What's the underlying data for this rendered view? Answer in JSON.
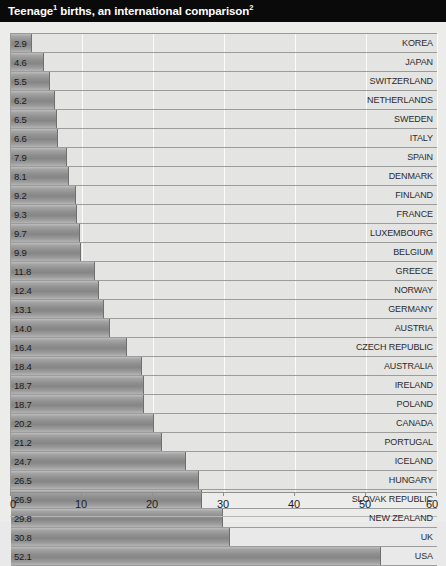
{
  "header": {
    "title_part1": "Teenage",
    "title_sup1": "1",
    "title_part2": " births,  an international comparison",
    "title_sup2": "2",
    "title_full": "Teenage¹ births,  an international comparison²",
    "background_color": "#0a0a0a",
    "text_color": "#ffffff"
  },
  "chart_data": {
    "type": "bar",
    "orientation": "horizontal",
    "xlabel": "",
    "ylabel": "",
    "xlim": [
      0,
      60
    ],
    "xticks": [
      "0",
      "10",
      "20",
      "30",
      "40",
      "50",
      "60"
    ],
    "xtick_values": [
      0,
      10,
      20,
      30,
      40,
      50,
      60
    ],
    "grid": "vertical",
    "legend": "none",
    "bar_color": "#8e8e8e",
    "categories": [
      "KOREA",
      "JAPAN",
      "SWITZERLAND",
      "NETHERLANDS",
      "SWEDEN",
      "ITALY",
      "SPAIN",
      "DENMARK",
      "FINLAND",
      "FRANCE",
      "LUXEMBOURG",
      "BELGIUM",
      "GREECE",
      "NORWAY",
      "GERMANY",
      "AUSTRIA",
      "CZECH REPUBLIC",
      "AUSTRALIA",
      "IRELAND",
      "POLAND",
      "CANADA",
      "PORTUGAL",
      "ICELAND",
      "HUNGARY",
      "SLOVAK REPUBLIC",
      "NEW ZEALAND",
      "UK",
      "USA"
    ],
    "values": [
      2.9,
      4.6,
      5.5,
      6.2,
      6.5,
      6.6,
      7.9,
      8.1,
      9.2,
      9.3,
      9.7,
      9.9,
      11.8,
      12.4,
      13.1,
      14.0,
      16.4,
      18.4,
      18.7,
      18.7,
      20.2,
      21.2,
      24.7,
      26.5,
      26.9,
      29.8,
      30.8,
      52.1
    ],
    "value_labels": [
      "2.9",
      "4.6",
      "5.5",
      "6.2",
      "6.5",
      "6.6",
      "7.9",
      "8.1",
      "9.2",
      "9.3",
      "9.7",
      "9.9",
      "11.8",
      "12.4",
      "13.1",
      "14.0",
      "16.4",
      "18.4",
      "18.7",
      "18.7",
      "20.2",
      "21.2",
      "24.7",
      "26.5",
      "26.9",
      "29.8",
      "30.8",
      "52.1"
    ]
  }
}
